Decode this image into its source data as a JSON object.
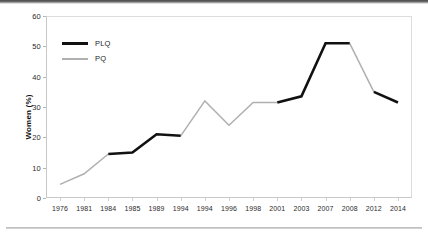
{
  "chart_data": {
    "type": "line",
    "title": "",
    "xlabel": "",
    "ylabel": "Women (%)",
    "ylim": [
      0,
      60
    ],
    "yticks": [
      0,
      10,
      20,
      30,
      40,
      50,
      60
    ],
    "grid": false,
    "legend_position": "top-left",
    "categories": [
      "1976",
      "1981",
      "1984",
      "1985",
      "1989",
      "1994",
      "1994",
      "1996",
      "1998",
      "2001",
      "2003",
      "2007",
      "2008",
      "2012",
      "2014"
    ],
    "values": [
      4.5,
      8.0,
      14.5,
      15.0,
      21.0,
      20.5,
      32.0,
      24.0,
      31.5,
      31.5,
      33.5,
      51.0,
      51.0,
      35.0,
      31.5
    ],
    "series": [
      {
        "name": "PLQ",
        "color": "#111111",
        "segments": [
          {
            "from_index": 2,
            "to_index": 5
          },
          {
            "from_index": 9,
            "to_index": 12
          },
          {
            "from_index": 13,
            "to_index": 14
          }
        ]
      },
      {
        "name": "PQ",
        "color": "#b0b0b0",
        "segments": [
          {
            "from_index": 0,
            "to_index": 2
          },
          {
            "from_index": 5,
            "to_index": 9
          },
          {
            "from_index": 12,
            "to_index": 13
          }
        ]
      }
    ],
    "points": [
      {
        "category": "1976",
        "value": 4.5,
        "party": "PQ"
      },
      {
        "category": "1981",
        "value": 8.0,
        "party": "PQ"
      },
      {
        "category": "1984",
        "value": 14.5,
        "party": "PLQ"
      },
      {
        "category": "1985",
        "value": 15.0,
        "party": "PLQ"
      },
      {
        "category": "1989",
        "value": 21.0,
        "party": "PLQ"
      },
      {
        "category": "1994",
        "value": 20.5,
        "party": "PLQ"
      },
      {
        "category": "1994",
        "value": 32.0,
        "party": "PQ"
      },
      {
        "category": "1996",
        "value": 24.0,
        "party": "PQ"
      },
      {
        "category": "1998",
        "value": 31.5,
        "party": "PQ"
      },
      {
        "category": "2001",
        "value": 31.5,
        "party": "PQ"
      },
      {
        "category": "2003",
        "value": 33.5,
        "party": "PLQ"
      },
      {
        "category": "2007",
        "value": 51.0,
        "party": "PLQ"
      },
      {
        "category": "2008",
        "value": 51.0,
        "party": "PLQ"
      },
      {
        "category": "2012",
        "value": 35.0,
        "party": "PQ"
      },
      {
        "category": "2014",
        "value": 31.5,
        "party": "PLQ"
      }
    ]
  },
  "legend": {
    "items": [
      {
        "label": "PLQ",
        "color": "#111111"
      },
      {
        "label": "PQ",
        "color": "#b0b0b0"
      }
    ]
  }
}
